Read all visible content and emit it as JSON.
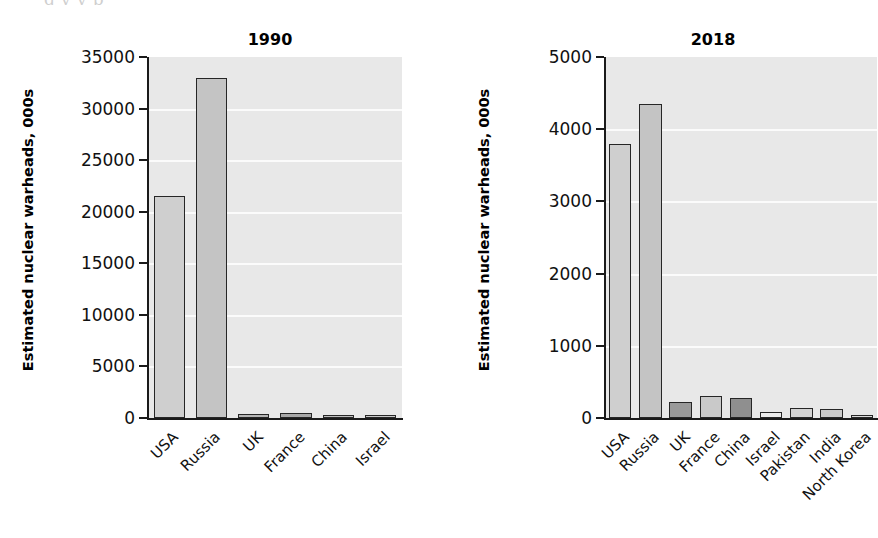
{
  "page": {
    "top_fragment": "g      y        y          p"
  },
  "axis_title": "Estimated nuclear warheads, 000s",
  "colors": {
    "plot_background": "#e8e8e8",
    "gridline": "#fbfbfb",
    "bar_outline": "#262626",
    "bar_light": "#cfcfcf",
    "bar_mid": "#bdbdbd",
    "bar_dark": "#9a9a9a",
    "bar_pale": "#e4e4e4",
    "text": "#111111"
  },
  "chart_data": [
    {
      "type": "bar",
      "title": "1990",
      "xlabel": "",
      "ylabel": "Estimated nuclear warheads, 000s",
      "ylim": [
        0,
        35000
      ],
      "yticks": [
        0,
        5000,
        10000,
        15000,
        20000,
        25000,
        30000,
        35000
      ],
      "ytick_labels": [
        "0",
        "5000",
        "10000",
        "15000",
        "20000",
        "25000",
        "30000",
        "35000"
      ],
      "grid": true,
      "legend": "none",
      "categories": [
        "USA",
        "Russia",
        "UK",
        "France",
        "China",
        "Israel"
      ],
      "values": [
        21500,
        33000,
        350,
        500,
        250,
        150
      ],
      "bar_colors": [
        "#cfcfcf",
        "#c4c4c4",
        "#b5b5b5",
        "#a8a8a8",
        "#bdbdbd",
        "#c9c9c9"
      ]
    },
    {
      "type": "bar",
      "title": "2018",
      "xlabel": "",
      "ylabel": "Estimated nuclear warheads, 000s",
      "ylim": [
        0,
        5000
      ],
      "yticks": [
        0,
        1000,
        2000,
        3000,
        4000,
        5000
      ],
      "ytick_labels": [
        "0",
        "1000",
        "2000",
        "3000",
        "4000",
        "5000"
      ],
      "grid": true,
      "legend": "none",
      "categories": [
        "USA",
        "Russia",
        "UK",
        "France",
        "China",
        "Israel",
        "Pakistan",
        "India",
        "North Korea"
      ],
      "values": [
        3800,
        4350,
        215,
        300,
        280,
        80,
        140,
        130,
        25
      ],
      "bar_colors": [
        "#cfcfcf",
        "#c4c4c4",
        "#9a9a9a",
        "#c9c9c9",
        "#8f8f8f",
        "#ececec",
        "#d2d2d2",
        "#cacaca",
        "#dcdcdc"
      ]
    }
  ]
}
